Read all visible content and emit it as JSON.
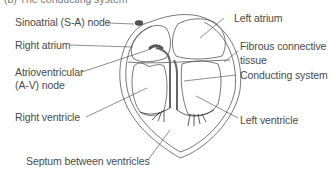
{
  "caption": "(b) The conducting system",
  "labels": {
    "sa_node": "Sinoatrial (S-A) node",
    "right_atrium": "Right atrium",
    "av_node_line1": "Atrioventricular",
    "av_node_line2": "(A-V) node",
    "right_ventricle": "Right ventricle",
    "septum": "Septum between ventricles",
    "left_atrium": "Left atrium",
    "fibrous_line1": "Fibrous connective",
    "fibrous_line2": "tissue",
    "conducting_system": "Conducting system",
    "left_ventricle": "Left ventricle"
  },
  "colors": {
    "outline": "#555555",
    "conductor": "#666666",
    "node_fill": "#555555",
    "leader": "#444444",
    "text": "#4a4a4a"
  }
}
